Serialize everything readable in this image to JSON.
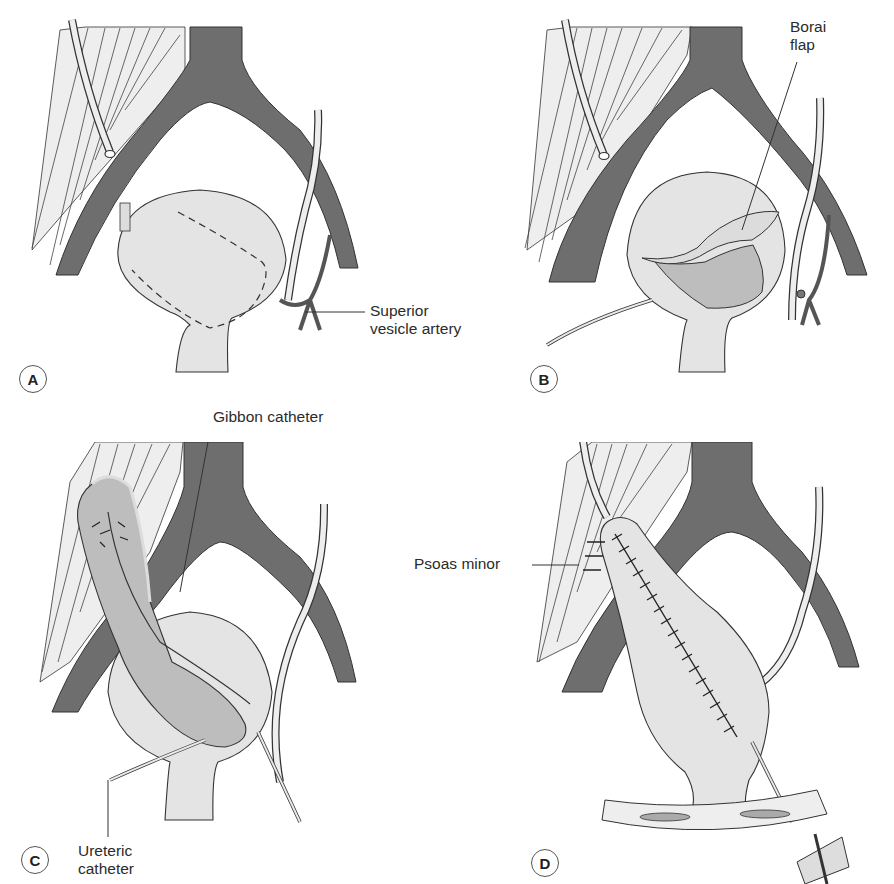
{
  "figure": {
    "panels": [
      {
        "id": "A",
        "badge": "A",
        "labels": {
          "superior_vesicle_artery_line1": "Superior",
          "superior_vesicle_artery_line2": "vesicle artery"
        }
      },
      {
        "id": "B",
        "badge": "B",
        "labels": {
          "borai_flap_line1": "Borai",
          "borai_flap_line2": "flap"
        }
      },
      {
        "id": "C",
        "badge": "C",
        "labels": {
          "gibbon_catheter": "Gibbon catheter",
          "ureteric_catheter_line1": "Ureteric",
          "ureteric_catheter_line2": "catheter"
        }
      },
      {
        "id": "D",
        "badge": "D",
        "labels": {
          "psoas_minor": "Psoas minor"
        }
      }
    ],
    "colors": {
      "vessel": "#6e6e6e",
      "bladder": "#e4e4e4",
      "bladder_dark": "#bdbdbd",
      "muscle": "#ededed",
      "outline": "#333333",
      "background": "#ffffff"
    }
  }
}
